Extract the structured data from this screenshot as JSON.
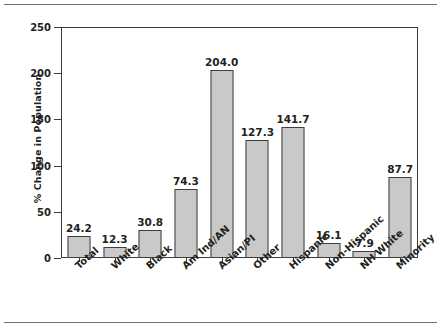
{
  "figure": {
    "background": "#ffffff",
    "frame_color": "#3c3c3c",
    "bar_fill": "#c9c9c9",
    "bar_border": "#3f3f3f",
    "text_color": "#231f20",
    "rule_color": "#6f6f6f"
  },
  "chart_data": {
    "type": "bar",
    "title": "",
    "subtitle": "",
    "xlabel": "",
    "ylabel": "% Change in Population",
    "categories": [
      "Total",
      "White",
      "Black",
      "Am Ind/AN",
      "Asian/PI",
      "Other",
      "Hispanic",
      "Non-Hispanic",
      "NH White",
      "Minority"
    ],
    "values": [
      24.2,
      12.3,
      30.8,
      74.3,
      204.0,
      127.3,
      141.7,
      16.1,
      7.9,
      87.7
    ],
    "value_labels": [
      "24.2",
      "12.3",
      "30.8",
      "74.3",
      "204.0",
      "127.3",
      "141.7",
      "16.1",
      "7.9",
      "87.7"
    ],
    "ylim": [
      0,
      250
    ],
    "yticks": [
      0,
      50,
      100,
      150,
      200,
      250
    ],
    "ytick_labels": [
      "0",
      "50",
      "100",
      "150",
      "200",
      "250"
    ],
    "grid": false,
    "legend": null,
    "legend_position": "none",
    "annotations": []
  }
}
